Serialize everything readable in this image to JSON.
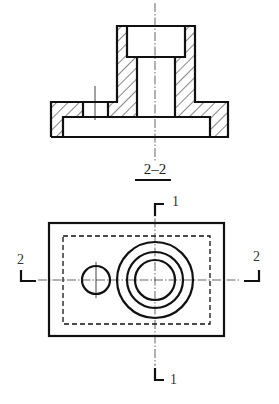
{
  "drawing": {
    "type": "engineering-drawing",
    "section_view": {
      "title": "2–2",
      "description": "Full section view of flanged part with counterbored boss, through hole, small hole in flange, and bottom recess"
    },
    "top_view": {
      "cutting_plane_1": {
        "label_top": "1",
        "label_bottom": "1"
      },
      "cutting_plane_2": {
        "label_left": "2",
        "label_right": "2"
      }
    },
    "colors": {
      "line": "#111111",
      "background": "#ffffff"
    }
  }
}
